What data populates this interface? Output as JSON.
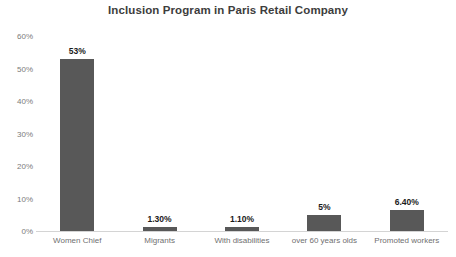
{
  "chart_data": {
    "type": "bar",
    "title": "Inclusion Program in Paris Retail Company",
    "xlabel": "",
    "ylabel": "",
    "categories": [
      "Women Chief",
      "Migrants",
      "With disabilities",
      "over 60 years olds",
      "Promoted workers"
    ],
    "values": [
      53,
      1.3,
      1.1,
      5,
      6.4
    ],
    "data_labels": [
      "53%",
      "1.30%",
      "1.10%",
      "5%",
      "6.40%"
    ],
    "ylim": [
      0,
      60
    ],
    "ytick_values": [
      0,
      10,
      20,
      30,
      40,
      50,
      60
    ],
    "ytick_labels": [
      "0%",
      "10%",
      "20%",
      "30%",
      "40%",
      "50%",
      "60%"
    ],
    "grid": false,
    "legend": false,
    "bar_color": "#585858",
    "axis_color": "#d4d4d4",
    "tick_label_color": "#7b7b7b",
    "title_color": "#3d3d3d",
    "background": "#ffffff"
  }
}
